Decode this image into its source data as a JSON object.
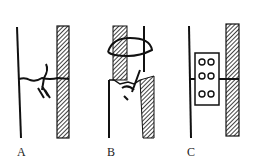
{
  "figure": {
    "panels": [
      {
        "id": "A",
        "label": "A",
        "description": "two poles joined by twisted wire tie"
      },
      {
        "id": "B",
        "label": "B",
        "description": "broken pole with wrapped collar and wire twist"
      },
      {
        "id": "C",
        "label": "C",
        "description": "two poles joined by bolted plate with six bolts"
      }
    ],
    "colors": {
      "ink": "#111111",
      "background": "#ffffff"
    }
  }
}
